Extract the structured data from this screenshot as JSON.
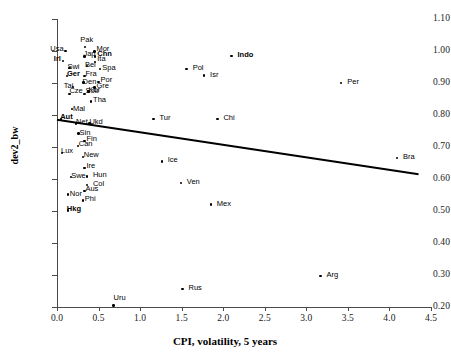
{
  "chart_data": {
    "type": "scatter",
    "title": "",
    "xlabel": "CPI, volatility, 5 years",
    "ylabel": "dev2_bw",
    "xlim": [
      0.0,
      4.5
    ],
    "ylim": [
      0.2,
      1.1
    ],
    "xticks": [
      "0.0",
      "0.5",
      "1.0",
      "1.5",
      "2.0",
      "2.5",
      "3.0",
      "3.5",
      "4.0",
      "4.5"
    ],
    "yticks": [
      "0.20",
      "0.30",
      "0.40",
      "0.50",
      "0.60",
      "0.70",
      "0.80",
      "0.90",
      "1.00",
      "1.10"
    ],
    "grid": false,
    "legend": null,
    "trendline": {
      "x": [
        0.0,
        4.35
      ],
      "y": [
        0.785,
        0.615
      ]
    },
    "points": [
      {
        "label": "Usa",
        "x": 0.1,
        "y": 1.0,
        "bold": false,
        "lx": -17,
        "ly": -4
      },
      {
        "label": "Pak",
        "x": 0.34,
        "y": 1.012,
        "bold": false,
        "lx": -7,
        "ly": -9
      },
      {
        "label": "Mor",
        "x": 0.45,
        "y": 0.998,
        "bold": false,
        "lx": 0,
        "ly": -5
      },
      {
        "label": "Jap",
        "x": 0.33,
        "y": 0.983,
        "bold": false,
        "lx": -3,
        "ly": -4
      },
      {
        "label": "Chn",
        "x": 0.46,
        "y": 0.983,
        "bold": true,
        "lx": 0,
        "ly": -4
      },
      {
        "label": "Irl",
        "x": 0.07,
        "y": 0.968,
        "bold": true,
        "lx": -11,
        "ly": -4
      },
      {
        "label": "Ita",
        "x": 0.46,
        "y": 0.966,
        "bold": false,
        "lx": 0,
        "ly": -5
      },
      {
        "label": "Bel",
        "x": 0.36,
        "y": 0.953,
        "bold": false,
        "lx": -4,
        "ly": -3
      },
      {
        "label": "Swi",
        "x": 0.15,
        "y": 0.947,
        "bold": false,
        "lx": -4,
        "ly": -3
      },
      {
        "label": "Spa",
        "x": 0.52,
        "y": 0.943,
        "bold": false,
        "lx": 0,
        "ly": -3
      },
      {
        "label": "Ger",
        "x": 0.12,
        "y": 0.922,
        "bold": true,
        "lx": -2,
        "ly": -4
      },
      {
        "label": "Fra",
        "x": 0.33,
        "y": 0.922,
        "bold": false,
        "lx": -1,
        "ly": -4
      },
      {
        "label": "Den",
        "x": 0.32,
        "y": 0.901,
        "bold": false,
        "lx": -3,
        "ly": -3
      },
      {
        "label": "Por",
        "x": 0.5,
        "y": 0.903,
        "bold": false,
        "lx": 0,
        "ly": -4
      },
      {
        "label": "Tai",
        "x": 0.19,
        "y": 0.888,
        "bold": false,
        "lx": -11,
        "ly": -3
      },
      {
        "label": "Gre",
        "x": 0.45,
        "y": 0.886,
        "bold": false,
        "lx": 0,
        "ly": -3
      },
      {
        "label": "Kor",
        "x": 0.38,
        "y": 0.873,
        "bold": false,
        "lx": -2,
        "ly": -4
      },
      {
        "label": "Cze",
        "x": 0.15,
        "y": 0.866,
        "bold": false,
        "lx": -2,
        "ly": -5
      },
      {
        "label": "Sou",
        "x": 0.33,
        "y": 0.866,
        "bold": false,
        "lx": -1,
        "ly": -5
      },
      {
        "label": "Tha",
        "x": 0.41,
        "y": 0.842,
        "bold": false,
        "lx": 0,
        "ly": -4
      },
      {
        "label": "Mal",
        "x": 0.18,
        "y": 0.818,
        "bold": false,
        "lx": -1,
        "ly": -2
      },
      {
        "label": "Aut",
        "x": 0.05,
        "y": 0.786,
        "bold": true,
        "lx": -3,
        "ly": -4
      },
      {
        "label": "Net",
        "x": 0.23,
        "y": 0.773,
        "bold": false,
        "lx": -2,
        "ly": -4
      },
      {
        "label": "Ukd",
        "x": 0.39,
        "y": 0.773,
        "bold": false,
        "lx": -2,
        "ly": -4
      },
      {
        "label": "Sin",
        "x": 0.26,
        "y": 0.742,
        "bold": false,
        "lx": -1,
        "ly": -3
      },
      {
        "label": "Fin",
        "x": 0.33,
        "y": 0.719,
        "bold": false,
        "lx": 0,
        "ly": -4
      },
      {
        "label": "Can",
        "x": 0.25,
        "y": 0.703,
        "bold": false,
        "lx": -1,
        "ly": -4
      },
      {
        "label": "Lux",
        "x": 0.06,
        "y": 0.682,
        "bold": false,
        "lx": -3,
        "ly": -4
      },
      {
        "label": "New",
        "x": 0.31,
        "y": 0.668,
        "bold": false,
        "lx": -1,
        "ly": -4
      },
      {
        "label": "Ice",
        "x": 1.26,
        "y": 0.655,
        "bold": false,
        "lx": 4,
        "ly": -3
      },
      {
        "label": "Ire",
        "x": 0.33,
        "y": 0.635,
        "bold": false,
        "lx": 0,
        "ly": -4
      },
      {
        "label": "Swe",
        "x": 0.17,
        "y": 0.606,
        "bold": false,
        "lx": -2,
        "ly": -3
      },
      {
        "label": "Hun",
        "x": 0.36,
        "y": 0.608,
        "bold": false,
        "lx": 4,
        "ly": -3
      },
      {
        "label": "Col",
        "x": 0.36,
        "y": 0.581,
        "bold": false,
        "lx": 4,
        "ly": -3
      },
      {
        "label": "Ven",
        "x": 1.49,
        "y": 0.587,
        "bold": false,
        "lx": 4,
        "ly": -3
      },
      {
        "label": "Aus",
        "x": 0.33,
        "y": 0.563,
        "bold": false,
        "lx": -1,
        "ly": -4
      },
      {
        "label": "Nor",
        "x": 0.13,
        "y": 0.551,
        "bold": false,
        "lx": 0,
        "ly": -3
      },
      {
        "label": "Phi",
        "x": 0.31,
        "y": 0.533,
        "bold": false,
        "lx": 0,
        "ly": -3
      },
      {
        "label": "Mex",
        "x": 1.85,
        "y": 0.52,
        "bold": false,
        "lx": 4,
        "ly": -3
      },
      {
        "label": "Hkg",
        "x": 0.13,
        "y": 0.502,
        "bold": true,
        "lx": -3,
        "ly": -3
      },
      {
        "label": "Tur",
        "x": 1.16,
        "y": 0.787,
        "bold": false,
        "lx": 4,
        "ly": -3
      },
      {
        "label": "Chi",
        "x": 1.93,
        "y": 0.787,
        "bold": false,
        "lx": 4,
        "ly": -3
      },
      {
        "label": "Pol",
        "x": 1.56,
        "y": 0.944,
        "bold": false,
        "lx": 4,
        "ly": -3
      },
      {
        "label": "Isr",
        "x": 1.77,
        "y": 0.923,
        "bold": false,
        "lx": 4,
        "ly": -3
      },
      {
        "label": "Indo",
        "x": 2.1,
        "y": 0.985,
        "bold": true,
        "lx": 4,
        "ly": -3
      },
      {
        "label": "Per",
        "x": 3.42,
        "y": 0.9,
        "bold": false,
        "lx": 4,
        "ly": -3
      },
      {
        "label": "Bra",
        "x": 4.09,
        "y": 0.666,
        "bold": false,
        "lx": 4,
        "ly": -3
      },
      {
        "label": "Uru",
        "x": 0.68,
        "y": 0.205,
        "bold": false,
        "lx": -2,
        "ly": -9
      },
      {
        "label": "Rus",
        "x": 1.51,
        "y": 0.256,
        "bold": false,
        "lx": 4,
        "ly": -3
      },
      {
        "label": "Arg",
        "x": 3.17,
        "y": 0.296,
        "bold": false,
        "lx": 4,
        "ly": -3
      }
    ]
  },
  "colors": {
    "axis": "#4a4a4a",
    "point": "#000000",
    "trendline": "#000000",
    "text": "#1a1a1a",
    "background": "#ffffff"
  }
}
